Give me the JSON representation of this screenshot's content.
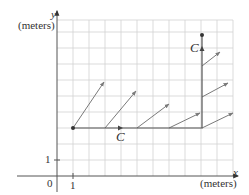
{
  "figure": {
    "type": "vector field along curve",
    "axes": {
      "x": {
        "label": "x",
        "unit": "(meters)",
        "tick_label": "1"
      },
      "y": {
        "label": "y",
        "unit": "(meters)",
        "tick_label": "1"
      },
      "origin_label": "0"
    },
    "curve": {
      "name": "C",
      "labels": [
        "C",
        "C"
      ],
      "segments": [
        {
          "from": [
            1,
            3
          ],
          "to": [
            9,
            3
          ],
          "direction": "right"
        },
        {
          "from": [
            9,
            3
          ],
          "to": [
            9,
            8.75
          ],
          "direction": "up"
        }
      ]
    },
    "vectors": [
      {
        "base": [
          1,
          3
        ],
        "tip": [
          3,
          5.9
        ]
      },
      {
        "base": [
          3,
          3
        ],
        "tip": [
          5,
          5.4
        ]
      },
      {
        "base": [
          5,
          3
        ],
        "tip": [
          7,
          4.4
        ]
      },
      {
        "base": [
          7,
          3
        ],
        "tip": [
          9,
          3.9
        ]
      },
      {
        "base": [
          9,
          3
        ],
        "tip": [
          11,
          3.9
        ]
      },
      {
        "base": [
          9,
          5
        ],
        "tip": [
          10.6,
          5.9
        ]
      },
      {
        "base": [
          9,
          6.9
        ],
        "tip": [
          10.1,
          7.7
        ]
      }
    ],
    "colors": {
      "grid": "#cfcfcf",
      "axis": "#555555",
      "curve": "#555555",
      "vector": "#7a7a7a",
      "text": "#333333"
    }
  }
}
